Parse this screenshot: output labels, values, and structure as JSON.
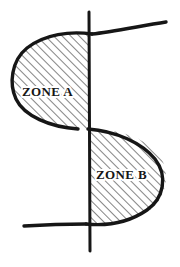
{
  "diagram": {
    "background_color": "#ffffff",
    "ink_color": "#161616",
    "hatch_color": "#2a2a2a",
    "style": "hand-drawn ink sketch",
    "axis": {
      "name": "vertical-dividing-line",
      "orientation": "vertical",
      "x": 89,
      "y_top": 12,
      "y_bottom": 251,
      "stroke_width": 3
    },
    "scurve": {
      "name": "s-shaped-boundary-curve",
      "stroke_width": 3.4,
      "top_arm_end": [
        166,
        22
      ],
      "bottom_arm_end": [
        24,
        225
      ],
      "crossing_point": [
        89,
        129
      ]
    },
    "zones": [
      {
        "id": "zone-a",
        "label": "ZONE A",
        "position": "upper-left",
        "label_x": 22,
        "label_y": 96,
        "fill": "hatched",
        "hatch_angle_deg": 45,
        "hatch_spacing_px": 6
      },
      {
        "id": "zone-b",
        "label": "ZONE B",
        "position": "lower-right",
        "label_x": 96,
        "label_y": 179,
        "fill": "hatched",
        "hatch_angle_deg": 45,
        "hatch_spacing_px": 6
      }
    ]
  }
}
